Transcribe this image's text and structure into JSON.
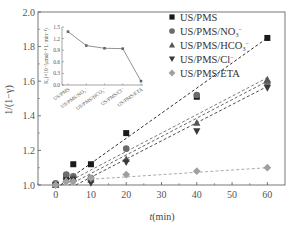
{
  "chart_data": {
    "type": "scatter",
    "title": "",
    "xlabel": "t(min)",
    "ylabel": "1/(1−γ)",
    "xlim": [
      -5,
      65
    ],
    "ylim": [
      1.0,
      2.0
    ],
    "xticks": [
      0,
      10,
      20,
      30,
      40,
      50,
      60
    ],
    "yticks": [
      1.0,
      1.2,
      1.4,
      1.6,
      1.8,
      2.0
    ],
    "ytick_labels": [
      "1.0",
      "1.2",
      "1.4",
      "1.6",
      "1.8",
      "2.0"
    ],
    "grid": false,
    "legend_position": "upper right",
    "fit_lines": "dashed linear fits per series",
    "x": [
      0,
      3,
      5,
      10,
      20,
      40,
      60
    ],
    "series": [
      {
        "name": "US/PMS",
        "marker": "square",
        "color": "#1a1a1a",
        "values": [
          1.0,
          1.05,
          1.12,
          1.12,
          1.3,
          1.51,
          1.85
        ],
        "fit": [
          0.98,
          1.85
        ]
      },
      {
        "name": "US/PMS/NO3−",
        "marker": "circle",
        "color": "#6b6b6b",
        "values": [
          1.01,
          1.06,
          1.05,
          1.04,
          1.21,
          1.52,
          1.59
        ],
        "fit": [
          0.98,
          1.62
        ]
      },
      {
        "name": "US/PMS/HCO3−",
        "marker": "triangle-up",
        "color": "#555555",
        "values": [
          1.0,
          1.03,
          1.04,
          1.03,
          1.15,
          1.36,
          1.61
        ],
        "fit": [
          0.96,
          1.6
        ]
      },
      {
        "name": "US/PMS/Cl−",
        "marker": "triangle-down",
        "color": "#3a3a3a",
        "values": [
          1.0,
          1.02,
          1.03,
          1.01,
          1.13,
          1.31,
          1.56
        ],
        "fit": [
          0.94,
          1.57
        ]
      },
      {
        "name": "US/PMS/ETA",
        "marker": "diamond",
        "color": "#a0a0a0",
        "values": [
          1.0,
          1.02,
          1.02,
          1.04,
          1.06,
          1.08,
          1.1
        ],
        "fit": [
          1.02,
          1.1
        ]
      }
    ],
    "inset": {
      "type": "line",
      "ylabel": "K1 (×10⁻² μmol⁻¹·L·min⁻¹)",
      "categories": [
        "US/PMS",
        "US/PMS/NO3−",
        "US/PMS/HCO3−",
        "US/PMS/Cl−",
        "US/PMS/ETA"
      ],
      "values": [
        1.38,
        1.02,
        0.95,
        0.94,
        0.1
      ],
      "ylim": [
        0,
        1.5
      ],
      "yticks": [
        0.0,
        0.3,
        0.6,
        0.9,
        1.2,
        1.5
      ],
      "ytick_labels": [
        "0.0",
        "0.3",
        "0.6",
        "0.9",
        "1.2",
        "1.5"
      ]
    }
  },
  "labels": {
    "xlabel_italic": "t",
    "xlabel_rest": "(min)",
    "ylabel": "1/(1−γ)",
    "inset_ylabel": "K₁(×10⁻²μmol⁻¹·L·min⁻¹)"
  },
  "legend": [
    {
      "base": "US/PMS",
      "sub": "",
      "sup": ""
    },
    {
      "base": "US/PMS/NO",
      "sub": "3",
      "sup": "−"
    },
    {
      "base": "US/PMS/HCO",
      "sub": "3",
      "sup": "−"
    },
    {
      "base": "US/PMS/Cl",
      "sub": "",
      "sup": "−"
    },
    {
      "base": "US/PMS/ETA",
      "sub": "",
      "sup": ""
    }
  ],
  "inset_xlabels": [
    "US/PMS",
    "US/PMS/NO₃⁻",
    "US/PMS/HCO₃⁻",
    "US/PMS/Cl⁻",
    "US/PMS/ETA"
  ]
}
